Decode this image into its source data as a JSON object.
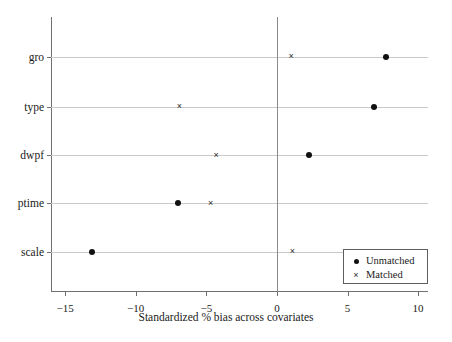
{
  "chart_data": {
    "type": "scatter",
    "title": "",
    "xlabel": "Standardized % bias across covariates",
    "ylabel": "",
    "xlim": [
      -16,
      10.7
    ],
    "ylim": [
      0,
      6
    ],
    "grid": true,
    "xticks": [
      -15,
      -10,
      -5,
      0,
      5,
      10
    ],
    "xtick_labels": [
      "−15",
      "−10",
      "−5",
      "0",
      "5",
      "10"
    ],
    "categories": [
      "gro",
      "type",
      "dwpf",
      "ptime",
      "scale"
    ],
    "zero_reference": 0,
    "legend_position": "bottom-right",
    "series": [
      {
        "name": "Unmatched",
        "marker": "circle",
        "color": "#111111",
        "values": [
          7.7,
          6.9,
          2.3,
          -7.0,
          -13.1
        ]
      },
      {
        "name": "Matched",
        "marker": "x",
        "color": "#2b2b2b",
        "values": [
          1.0,
          -6.9,
          -4.3,
          -4.7,
          1.1
        ]
      }
    ]
  },
  "legend": {
    "items": [
      {
        "symbol": "filled-circle",
        "label": "Unmatched"
      },
      {
        "symbol": "x-mark",
        "label": "Matched"
      }
    ]
  },
  "colors": {
    "marker": "#111111",
    "gridline": "#c9c9c9",
    "axis": "#6f6f6f",
    "zero_line": "#8a8a8a",
    "background": "#ffffff"
  }
}
